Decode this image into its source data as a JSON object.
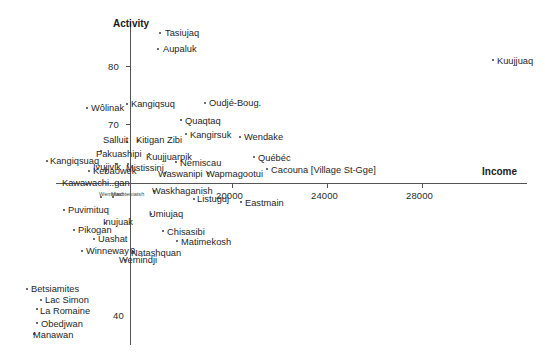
{
  "chart_data": {
    "type": "scatter",
    "title": "",
    "xlabel": "Income",
    "ylabel": "Activity",
    "xlim": [
      16800,
      29600
    ],
    "ylim": [
      33.5,
      86.5
    ],
    "grid": false,
    "legend": null,
    "xticks": [
      {
        "value": 0,
        "label": "0"
      },
      {
        "value": 20000,
        "label": "20000"
      },
      {
        "value": 24000,
        "label": "24000"
      },
      {
        "value": 28000,
        "label": "28000"
      }
    ],
    "yticks": [
      {
        "value": 80,
        "label": "80"
      },
      {
        "value": 70,
        "label": "70"
      },
      {
        "value": 40,
        "label": "40"
      }
    ],
    "points": [
      {
        "label": "Tasiujaq",
        "px": 159,
        "py": 32,
        "lx": 165,
        "ly": 29,
        "anchor": "left"
      },
      {
        "label": "Aupaluk",
        "px": 157,
        "py": 48,
        "lx": 163,
        "ly": 45,
        "anchor": "left"
      },
      {
        "label": "Kuujjuaq",
        "px": 492,
        "py": 59,
        "lx": 497,
        "ly": 57,
        "anchor": "left"
      },
      {
        "label": "Kangiqsuq",
        "px": 126,
        "py": 103,
        "lx": 131,
        "ly": 100,
        "anchor": "left"
      },
      {
        "label": "Oudjé-Boug.",
        "px": 204,
        "py": 102,
        "lx": 209,
        "ly": 99,
        "anchor": "left"
      },
      {
        "label": "Wôlinak",
        "px": 86,
        "py": 107,
        "lx": 91,
        "ly": 104,
        "anchor": "left"
      },
      {
        "label": "Quaqtaq",
        "px": 180,
        "py": 119,
        "lx": 185,
        "ly": 117,
        "anchor": "left"
      },
      {
        "label": "Kangirsuk",
        "px": 185,
        "py": 133,
        "lx": 190,
        "ly": 131,
        "anchor": "left"
      },
      {
        "label": "Wendake",
        "px": 239,
        "py": 136,
        "lx": 244,
        "ly": 133,
        "anchor": "left"
      },
      {
        "label": "Salluit",
        "px": 126,
        "py": 141,
        "lx": 103,
        "ly": 136,
        "anchor": "left"
      },
      {
        "label": "Kitigan Zibi",
        "px": 137,
        "py": 140,
        "lx": 136,
        "ly": 136,
        "anchor": "left"
      },
      {
        "label": "Pakuashipi",
        "px": 100,
        "py": 150,
        "lx": 96,
        "ly": 150,
        "anchor": "left"
      },
      {
        "label": "Kuujjuarpik",
        "px": 148,
        "py": 153,
        "lx": 146,
        "ly": 153,
        "anchor": "left"
      },
      {
        "label": "Québéc",
        "px": 253,
        "py": 156,
        "lx": 258,
        "ly": 154,
        "anchor": "left"
      },
      {
        "label": "Kangiqsuaq",
        "px": 46,
        "py": 160,
        "lx": 50,
        "ly": 157,
        "anchor": "left"
      },
      {
        "label": "Ivujivik",
        "px": 115,
        "py": 163,
        "lx": 93,
        "ly": 163,
        "anchor": "left"
      },
      {
        "label": "Mistissini",
        "px": 127,
        "py": 163,
        "lx": 126,
        "ly": 164,
        "anchor": "left"
      },
      {
        "label": "Nemiscau",
        "px": 175,
        "py": 161,
        "lx": 180,
        "ly": 159,
        "anchor": "left"
      },
      {
        "label": "Kebaowek",
        "px": 88,
        "py": 170,
        "lx": 93,
        "ly": 167,
        "anchor": "left"
      },
      {
        "label": "Waswanipi",
        "px": 164,
        "py": 172,
        "lx": 158,
        "ly": 170,
        "anchor": "left"
      },
      {
        "label": "Wapmagootui",
        "px": 207,
        "py": 172,
        "lx": 206,
        "ly": 170,
        "anchor": "left"
      },
      {
        "label": "Cacouna  [Village St-Gge]",
        "px": 266,
        "py": 168,
        "lx": 271,
        "ly": 166,
        "anchor": "left"
      },
      {
        "label": "Kawawachi..gan",
        "px": 85,
        "py": 183,
        "lx": 62,
        "ly": 179,
        "anchor": "left"
      },
      {
        "label": "Waskhaganish",
        "px": 153,
        "py": 190,
        "lx": 152,
        "ly": 187,
        "anchor": "left"
      },
      {
        "label": "Listuguj",
        "px": 193,
        "py": 198,
        "lx": 197,
        "ly": 195,
        "anchor": "left"
      },
      {
        "label": "Eastmain",
        "px": 240,
        "py": 201,
        "lx": 245,
        "ly": 199,
        "anchor": "left"
      },
      {
        "label": "Wemotaci",
        "px": 100,
        "py": 196,
        "lx": 99,
        "ly": 192,
        "anchor": "left"
      },
      {
        "label": "Mashteuiatsh",
        "px": 112,
        "py": 196,
        "lx": 111,
        "ly": 192,
        "anchor": "left"
      },
      {
        "label": "Puvimituq",
        "px": 63,
        "py": 209,
        "lx": 68,
        "ly": 206,
        "anchor": "left"
      },
      {
        "label": "Umiujaq",
        "px": 150,
        "py": 213,
        "lx": 149,
        "ly": 210,
        "anchor": "left"
      },
      {
        "label": "Inujuak",
        "px": 104,
        "py": 222,
        "lx": 103,
        "ly": 218,
        "anchor": "left"
      },
      {
        "label": "Pikogan",
        "px": 73,
        "py": 229,
        "lx": 78,
        "ly": 226,
        "anchor": "left"
      },
      {
        "label": "Chisasibi",
        "px": 162,
        "py": 230,
        "lx": 167,
        "ly": 228,
        "anchor": "left"
      },
      {
        "label": "Uashat",
        "px": 93,
        "py": 238,
        "lx": 98,
        "ly": 235,
        "anchor": "left"
      },
      {
        "label": "Matimekosh",
        "px": 176,
        "py": 240,
        "lx": 181,
        "ly": 238,
        "anchor": "left"
      },
      {
        "label": "Winneway",
        "px": 81,
        "py": 250,
        "lx": 86,
        "ly": 247,
        "anchor": "left"
      },
      {
        "label": "Natashquan",
        "px": 132,
        "py": 251,
        "lx": 131,
        "ly": 249,
        "anchor": "left"
      },
      {
        "label": "Wemindji",
        "px": 124,
        "py": 259,
        "lx": 119,
        "ly": 256,
        "anchor": "left"
      },
      {
        "label": "Betsiamites",
        "px": 26,
        "py": 288,
        "lx": 31,
        "ly": 285,
        "anchor": "left"
      },
      {
        "label": "Lac Simon",
        "px": 40,
        "py": 299,
        "lx": 45,
        "ly": 296,
        "anchor": "left"
      },
      {
        "label": "La Romaine",
        "px": 36,
        "py": 308,
        "lx": 40,
        "ly": 307,
        "anchor": "left"
      },
      {
        "label": "Obedjwan",
        "px": 36,
        "py": 322,
        "lx": 41,
        "ly": 320,
        "anchor": "left"
      },
      {
        "label": "Manawan",
        "px": 33,
        "py": 333,
        "lx": 33,
        "ly": 331,
        "anchor": "left"
      }
    ],
    "axis_geometry": {
      "x_axis_y_px": 183,
      "y_axis_x_px": 130,
      "x_axis_left_px": 56,
      "x_axis_right_px": 527,
      "y_axis_top_px": 22,
      "y_axis_bottom_px": 345
    }
  }
}
